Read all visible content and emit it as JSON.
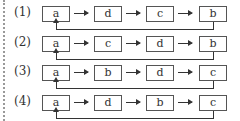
{
  "diagram": {
    "rows": [
      {
        "label": "(1)",
        "nodes": [
          "a",
          "d",
          "c",
          "b"
        ],
        "feedback": "b to a"
      },
      {
        "label": "(2)",
        "nodes": [
          "a",
          "c",
          "d",
          "b"
        ],
        "feedback": "b to a"
      },
      {
        "label": "(3)",
        "nodes": [
          "a",
          "b",
          "d",
          "c"
        ],
        "feedback": "c to a"
      },
      {
        "label": "(4)",
        "nodes": [
          "a",
          "d",
          "b",
          "c"
        ],
        "feedback": "c to a"
      }
    ]
  }
}
